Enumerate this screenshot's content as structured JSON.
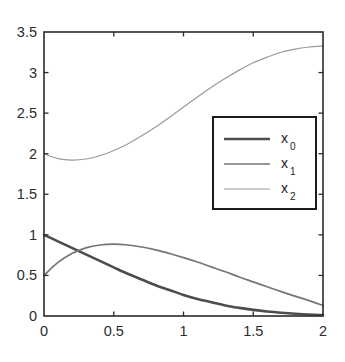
{
  "chart_data": {
    "type": "line",
    "title": "",
    "subtitle": "",
    "xlabel": "",
    "ylabel": "",
    "xlim": [
      0,
      2
    ],
    "ylim": [
      0,
      3.5
    ],
    "grid": false,
    "legend_position": "center-right",
    "x_ticks": [
      "0",
      "0.5",
      "1",
      "1.5",
      "2"
    ],
    "x_tick_values": [
      0,
      0.5,
      1,
      1.5,
      2
    ],
    "y_ticks": [
      "0",
      "0.5",
      "1",
      "1.5",
      "2",
      "2.5",
      "3",
      "3.5"
    ],
    "y_tick_values": [
      0,
      0.5,
      1,
      1.5,
      2,
      2.5,
      3,
      3.5
    ],
    "x": [
      0,
      0.1,
      0.2,
      0.3,
      0.4,
      0.5,
      0.6,
      0.7,
      0.8,
      0.9,
      1.0,
      1.1,
      1.2,
      1.3,
      1.4,
      1.5,
      1.6,
      1.7,
      1.8,
      1.9,
      2.0
    ],
    "series": [
      {
        "name": "x_0",
        "label": "x",
        "subscript": "0",
        "color": "#4d4d4d",
        "width": 2.6,
        "values": [
          1.0,
          0.92,
          0.84,
          0.76,
          0.68,
          0.6,
          0.52,
          0.45,
          0.38,
          0.32,
          0.26,
          0.21,
          0.17,
          0.13,
          0.1,
          0.075,
          0.055,
          0.04,
          0.028,
          0.018,
          0.012
        ]
      },
      {
        "name": "x_1",
        "label": "x",
        "subscript": "1",
        "color": "#757575",
        "width": 1.7,
        "values": [
          0.5,
          0.66,
          0.77,
          0.84,
          0.875,
          0.885,
          0.875,
          0.85,
          0.815,
          0.77,
          0.72,
          0.665,
          0.605,
          0.545,
          0.48,
          0.42,
          0.36,
          0.3,
          0.245,
          0.19,
          0.13
        ]
      },
      {
        "name": "x_2",
        "label": "x",
        "subscript": "2",
        "color": "#9a9a9a",
        "width": 1.2,
        "values": [
          2.0,
          1.94,
          1.922,
          1.935,
          1.975,
          2.04,
          2.12,
          2.22,
          2.33,
          2.45,
          2.575,
          2.7,
          2.82,
          2.93,
          3.03,
          3.12,
          3.19,
          3.25,
          3.29,
          3.315,
          3.33
        ]
      }
    ]
  },
  "axes": {
    "frame_color": "#2b2b2b",
    "tick_color": "#2b2b2b"
  },
  "legend": {
    "entries": [
      {
        "label": "x",
        "subscript": "0"
      },
      {
        "label": "x",
        "subscript": "1"
      },
      {
        "label": "x",
        "subscript": "2"
      }
    ],
    "border_color": "#1c1c1c",
    "background": "#ffffff"
  }
}
